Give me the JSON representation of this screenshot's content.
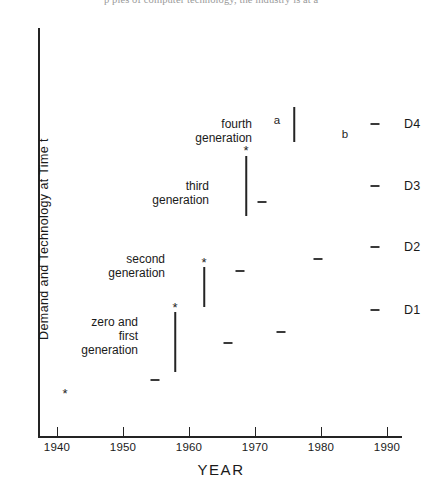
{
  "page": {
    "top_text_fragment": "p                      ples of computer technology, the industry is at a"
  },
  "chart_data": {
    "type": "scatter",
    "title": "",
    "xlabel": "YEAR",
    "ylabel": "Demand and Technology at Time t",
    "xlim": [
      1937,
      1993
    ],
    "ylim": [
      0,
      1
    ],
    "grid": false,
    "legend": "none",
    "xticks": [
      1940,
      1950,
      1960,
      1970,
      1980,
      1990
    ],
    "xtick_labels": [
      "1940",
      "1950",
      "1960",
      "1970",
      "1980",
      "1990"
    ],
    "right_axis_labels": [
      {
        "label": "D4",
        "y_px": 124
      },
      {
        "label": "D3",
        "y_px": 186
      },
      {
        "label": "D2",
        "y_px": 247
      },
      {
        "label": "D1",
        "y_px": 310
      }
    ],
    "annotations": [
      {
        "text": "fourth\ngeneration",
        "x_px": 252,
        "y_px": 117
      },
      {
        "text": "third\ngeneration",
        "x_px": 209,
        "y_px": 179
      },
      {
        "text": "second\ngeneration",
        "x_px": 165,
        "y_px": 252
      },
      {
        "text": "zero and\nfirst\ngeneration",
        "x_px": 138,
        "y_px": 315
      }
    ],
    "point_letters": [
      {
        "label": "a",
        "x_px": 277,
        "y_px": 120
      },
      {
        "label": "b",
        "x_px": 345,
        "y_px": 134
      }
    ],
    "series": [
      {
        "name": "asterisk markers",
        "marker": "*",
        "points": [
          {
            "x_px": 65,
            "y_px": 393
          },
          {
            "x_px": 175,
            "y_px": 307
          },
          {
            "x_px": 204,
            "y_px": 262
          },
          {
            "x_px": 246,
            "y_px": 150
          }
        ]
      },
      {
        "name": "dash markers",
        "marker": "-",
        "points": [
          {
            "x_px": 155,
            "y_px": 380
          },
          {
            "x_px": 228,
            "y_px": 343
          },
          {
            "x_px": 281,
            "y_px": 332
          },
          {
            "x_px": 375,
            "y_px": 310
          },
          {
            "x_px": 240,
            "y_px": 271
          },
          {
            "x_px": 318,
            "y_px": 259
          },
          {
            "x_px": 375,
            "y_px": 247
          },
          {
            "x_px": 262,
            "y_px": 202
          },
          {
            "x_px": 375,
            "y_px": 186
          },
          {
            "x_px": 375,
            "y_px": 124
          }
        ]
      },
      {
        "name": "vertical stems",
        "marker": "|",
        "segments": [
          {
            "x_px": 175,
            "y_top_px": 312,
            "y_bottom_px": 372
          },
          {
            "x_px": 204,
            "y_px_top": 267,
            "y_top_px": 267,
            "y_bottom_px": 307
          },
          {
            "x_px": 246,
            "y_top_px": 156,
            "y_bottom_px": 216
          },
          {
            "x_px": 294,
            "y_top_px": 107,
            "y_bottom_px": 142
          }
        ]
      }
    ]
  }
}
